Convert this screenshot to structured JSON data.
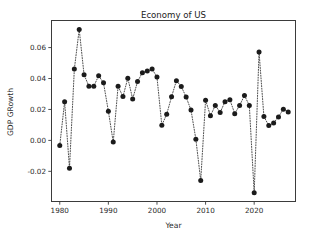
{
  "chart_data": {
    "type": "line",
    "title": "Economy of US",
    "xlabel": "Year",
    "ylabel": "GDP GRowth",
    "grid": false,
    "legend": null,
    "marker": "circle",
    "linestyle": "dotted",
    "color": "#1b1b1b",
    "xlim": [
      1978.3,
      1928.0
    ],
    "x_axis_range": [
      1978.3,
      2028.5
    ],
    "ylim": [
      -0.0395,
      0.0775
    ],
    "xticks": [
      1980,
      1990,
      2000,
      2010,
      2020
    ],
    "xticklabels": [
      "1980",
      "1990",
      "2000",
      "2010",
      "2020"
    ],
    "yticks": [
      -0.02,
      0.0,
      0.02,
      0.04,
      0.06
    ],
    "yticklabels": [
      "-0.02",
      "0.00",
      "0.02",
      "0.04",
      "0.06"
    ],
    "x": [
      1980,
      1981,
      1982,
      1983,
      1984,
      1985,
      1986,
      1987,
      1988,
      1989,
      1990,
      1991,
      1992,
      1993,
      1994,
      1995,
      1996,
      1997,
      1998,
      1999,
      2000,
      2001,
      2002,
      2003,
      2004,
      2005,
      2006,
      2007,
      2008,
      2009,
      2010,
      2011,
      2012,
      2013,
      2014,
      2015,
      2016,
      2017,
      2018,
      2019,
      2020,
      2021,
      2022,
      2023,
      2024,
      2025,
      2026,
      2027
    ],
    "y": [
      -0.0033,
      0.025,
      -0.018,
      0.0461,
      0.0717,
      0.0424,
      0.035,
      0.035,
      0.0418,
      0.0372,
      0.0189,
      -0.0011,
      0.035,
      0.0283,
      0.0402,
      0.0268,
      0.038,
      0.0438,
      0.0448,
      0.0461,
      0.041,
      0.0098,
      0.0169,
      0.0282,
      0.0386,
      0.0348,
      0.028,
      0.0196,
      0.0008,
      -0.026,
      0.026,
      0.0159,
      0.0226,
      0.0181,
      0.025,
      0.0263,
      0.0173,
      0.0226,
      0.029,
      0.0226,
      -0.0339,
      0.0571,
      0.0154,
      0.0096,
      0.0113,
      0.0152,
      0.0202,
      0.0184
    ],
    "series": [
      {
        "name": "GDP Growth",
        "values": [
          -0.0033,
          0.025,
          -0.018,
          0.0461,
          0.0717,
          0.0424,
          0.035,
          0.035,
          0.0418,
          0.0372,
          0.0189,
          -0.0011,
          0.035,
          0.0283,
          0.0402,
          0.0268,
          0.038,
          0.0438,
          0.0448,
          0.0461,
          0.041,
          0.0098,
          0.0169,
          0.0282,
          0.0386,
          0.0348,
          0.028,
          0.0196,
          0.0008,
          -0.026,
          0.026,
          0.0159,
          0.0226,
          0.0181,
          0.025,
          0.0263,
          0.0173,
          0.0226,
          0.029,
          0.0226,
          -0.0339,
          0.0571,
          0.0154,
          0.0096,
          0.0113,
          0.0152,
          0.0202,
          0.0184
        ]
      }
    ]
  }
}
